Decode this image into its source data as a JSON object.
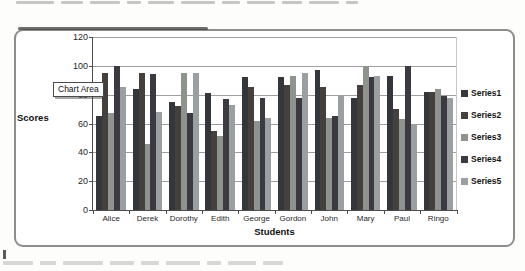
{
  "chart": {
    "tooltip": "Chart Area",
    "legend_title_labels": [
      "Series1",
      "Series2",
      "Series3",
      "Series4",
      "Series5"
    ]
  },
  "chart_data": {
    "type": "bar",
    "title": "",
    "xlabel": "Students",
    "ylabel": "Scores",
    "ylim": [
      0,
      120
    ],
    "yticks": [
      0,
      20,
      40,
      60,
      80,
      100,
      120
    ],
    "grid": true,
    "legend_position": "right",
    "categories": [
      "Alice",
      "Derek",
      "Dorothy",
      "Edith",
      "George",
      "Gordon",
      "John",
      "Mary",
      "Paul",
      "Ringo"
    ],
    "series": [
      {
        "name": "Series1",
        "color": "#33373c",
        "values": [
          65,
          84,
          75,
          81,
          92,
          92,
          97,
          78,
          93,
          82
        ]
      },
      {
        "name": "Series2",
        "color": "#453f3d",
        "values": [
          95,
          95,
          72,
          55,
          85,
          87,
          85,
          87,
          70,
          82
        ]
      },
      {
        "name": "Series3",
        "color": "#8f938e",
        "values": [
          67,
          46,
          95,
          51,
          62,
          93,
          64,
          100,
          63,
          84
        ]
      },
      {
        "name": "Series4",
        "color": "#3b3a43",
        "values": [
          100,
          94,
          67,
          77,
          78,
          78,
          65,
          92,
          100,
          79
        ]
      },
      {
        "name": "Series5",
        "color": "#9aa0a2",
        "values": [
          85,
          68,
          95,
          73,
          64,
          95,
          80,
          93,
          60,
          78
        ]
      }
    ]
  }
}
